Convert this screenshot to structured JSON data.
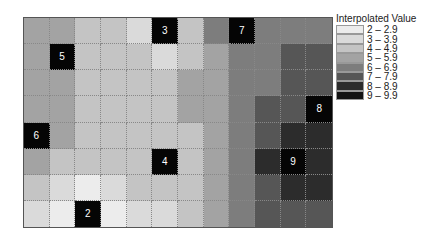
{
  "chart_data": {
    "type": "heatmap",
    "title": "",
    "legend_title": "Interpolated Value",
    "legend_position": "right",
    "grid": true,
    "rows": 8,
    "cols": 12,
    "classes": [
      {
        "label": "2 – 2.9",
        "min": 2,
        "max": 2.9,
        "color": "#ececec"
      },
      {
        "label": "3 – 3.9",
        "min": 3,
        "max": 3.9,
        "color": "#dadada"
      },
      {
        "label": "4 – 4.9",
        "min": 4,
        "max": 4.9,
        "color": "#c4c4c4"
      },
      {
        "label": "5 – 5.9",
        "min": 5,
        "max": 5.9,
        "color": "#a3a3a3"
      },
      {
        "label": "6 – 6.9",
        "min": 6,
        "max": 6.9,
        "color": "#7d7d7d"
      },
      {
        "label": "7 – 7.9",
        "min": 7,
        "max": 7.9,
        "color": "#565656"
      },
      {
        "label": "8 – 8.9",
        "min": 8,
        "max": 8.9,
        "color": "#2c2c2c"
      },
      {
        "label": "9 – 9.9",
        "min": 9,
        "max": 9.9,
        "color": "#141414"
      }
    ],
    "values": [
      [
        5,
        5,
        4,
        4,
        3,
        3,
        4,
        6,
        7,
        6,
        6,
        6
      ],
      [
        5,
        5,
        4,
        4,
        4,
        3,
        4,
        5,
        6,
        6,
        7,
        7
      ],
      [
        5,
        5,
        4,
        4,
        4,
        4,
        5,
        5,
        6,
        6,
        7,
        7
      ],
      [
        5,
        5,
        4,
        4,
        4,
        4,
        5,
        5,
        6,
        7,
        7,
        8
      ],
      [
        6,
        5,
        4,
        4,
        4,
        4,
        4,
        5,
        6,
        7,
        8,
        8
      ],
      [
        5,
        4,
        4,
        4,
        4,
        4,
        4,
        5,
        6,
        8,
        9,
        8
      ],
      [
        4,
        3,
        2,
        3,
        4,
        4,
        4,
        5,
        6,
        7,
        8,
        8
      ],
      [
        3,
        2,
        2,
        2,
        3,
        3,
        4,
        5,
        6,
        7,
        7,
        7
      ]
    ],
    "sample_points": [
      {
        "row": 0,
        "col": 5,
        "value": 3
      },
      {
        "row": 0,
        "col": 8,
        "value": 7
      },
      {
        "row": 1,
        "col": 1,
        "value": 5
      },
      {
        "row": 3,
        "col": 11,
        "value": 8
      },
      {
        "row": 4,
        "col": 0,
        "value": 6
      },
      {
        "row": 5,
        "col": 5,
        "value": 4
      },
      {
        "row": 5,
        "col": 10,
        "value": 9
      },
      {
        "row": 7,
        "col": 2,
        "value": 2
      }
    ]
  },
  "legend": {
    "title": "Interpolated Value",
    "items": [
      "2 – 2.9",
      "3 – 3.9",
      "4 – 4.9",
      "5 – 5.9",
      "6 – 6.9",
      "7 – 7.9",
      "8 – 8.9",
      "9 – 9.9"
    ]
  }
}
